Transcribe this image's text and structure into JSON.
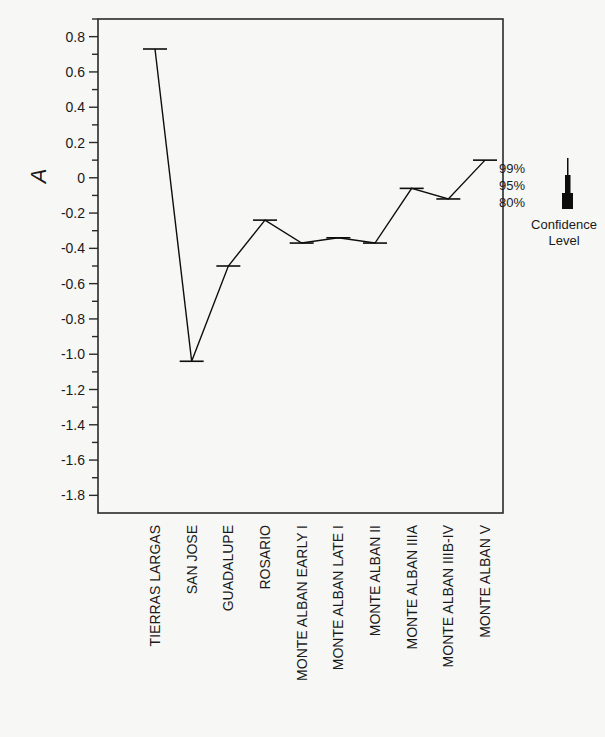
{
  "chart_data": {
    "type": "box",
    "title": "",
    "xlabel": "",
    "ylabel": "A",
    "ylim": [
      -1.9,
      0.9
    ],
    "yticks": [
      0.8,
      0.6,
      0.4,
      0.2,
      0,
      -0.2,
      -0.4,
      -0.6,
      -0.8,
      -1.0,
      -1.2,
      -1.4,
      -1.6,
      -1.8
    ],
    "ytick_labels": [
      "0.8",
      "0.6",
      "0.4",
      "0.2",
      "0",
      "-0.2",
      "-0.4",
      "-0.6",
      "-0.8",
      "-1.0",
      "-1.2",
      "-1.4",
      "-1.6",
      "-1.8"
    ],
    "minor_tick_step": 0.1,
    "grid": false,
    "mean_line": true,
    "categories": [
      "TIERRAS LARGAS",
      "SAN JOSE",
      "GUADALUPE",
      "ROSARIO",
      "MONTE ALBAN EARLY I",
      "MONTE ALBAN LATE I",
      "MONTE ALBAN II",
      "MONTE ALBAN IIIA",
      "MONTE ALBAN IIIB-IV",
      "MONTE ALBAN V"
    ],
    "series": [
      {
        "name": "mean",
        "values": [
          0.73,
          -1.04,
          -0.5,
          -0.24,
          -0.37,
          -0.34,
          -0.37,
          -0.06,
          -0.12,
          0.1
        ]
      },
      {
        "name": "ci80_low",
        "values": [
          0.68,
          -1.71,
          -0.87,
          -0.55,
          -0.69,
          -0.64,
          -0.65,
          -0.14,
          -0.23,
          0.05
        ]
      },
      {
        "name": "ci80_high",
        "values": [
          0.79,
          0.04,
          0.08,
          0.23,
          0.05,
          0.07,
          0.04,
          0.14,
          0.13,
          0.15
        ]
      },
      {
        "name": "ci95_low",
        "values": [
          0.66,
          -1.79,
          -1.02,
          -0.6,
          -0.75,
          -0.68,
          -0.69,
          -0.17,
          -0.27,
          0.02
        ]
      },
      {
        "name": "ci95_high",
        "values": [
          0.82,
          0.23,
          0.33,
          0.3,
          0.24,
          0.12,
          0.09,
          0.21,
          0.19,
          0.22
        ]
      },
      {
        "name": "ci99_low",
        "values": [
          0.62,
          -1.83,
          -1.1,
          -0.63,
          -0.79,
          -0.72,
          -0.72,
          -0.2,
          -0.3,
          -0.01
        ]
      },
      {
        "name": "ci99_high",
        "values": [
          0.85,
          0.29,
          0.45,
          0.39,
          0.28,
          0.27,
          0.15,
          0.25,
          0.24,
          0.27
        ]
      }
    ],
    "legend": {
      "position": "right",
      "entries": [
        "99%",
        "95%",
        "80%"
      ],
      "title_line1": "Confidence",
      "title_line2": "Level"
    }
  },
  "colors": {
    "ink": "#0d0d0d",
    "background": "#f7f7f6",
    "frame": "#2a2a2a"
  }
}
